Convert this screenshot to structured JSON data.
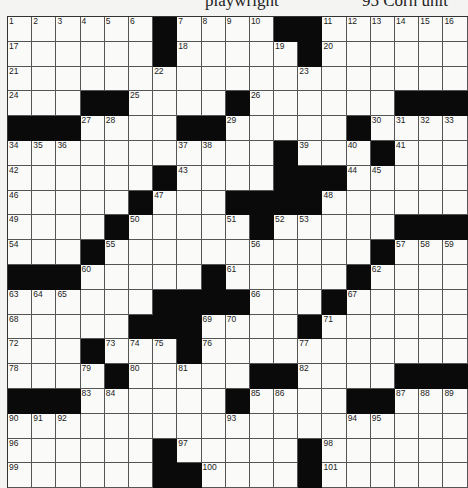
{
  "header_fragments": [
    {
      "text": "",
      "x": 30
    },
    {
      "text": "playwright",
      "x": 205
    },
    {
      "text": "95 Corn unit",
      "x": 362
    }
  ],
  "grid": {
    "cols": 19,
    "rows": 19,
    "rows_data": [
      [
        "1",
        "2",
        "3",
        "4",
        "5",
        "6",
        "#",
        "7",
        "8",
        "9",
        "10",
        "#",
        "#",
        "11",
        "12",
        "13",
        "14",
        "15",
        "16"
      ],
      [
        "17",
        "",
        "",
        "",
        "",
        "",
        "#",
        "18",
        "",
        "",
        "",
        "19",
        "#",
        "20",
        "",
        "",
        "",
        "",
        ""
      ],
      [
        "21",
        "",
        "",
        "",
        "",
        "",
        "22",
        "",
        "",
        "",
        "",
        "",
        "23",
        "",
        "",
        "",
        "",
        "",
        ""
      ],
      [
        "24",
        "",
        "",
        "#",
        "#",
        "25",
        "",
        "",
        "",
        "#",
        "26",
        "",
        "",
        "",
        "",
        "",
        "#",
        "#",
        "#"
      ],
      [
        "#",
        "#",
        "#",
        "27",
        "28",
        "",
        "",
        "#",
        "#",
        "29",
        "",
        "",
        "",
        "",
        "#",
        "30",
        "31",
        "32",
        "33"
      ],
      [
        "34",
        "35",
        "36",
        "",
        "",
        "",
        "",
        "37",
        "38",
        "",
        "",
        "#",
        "39",
        "",
        "40",
        "#",
        "41",
        "",
        ""
      ],
      [
        "42",
        "",
        "",
        "",
        "",
        "",
        "#",
        "43",
        "",
        "",
        "",
        "#",
        "#",
        "#",
        "44",
        "45",
        "",
        "",
        ""
      ],
      [
        "46",
        "",
        "",
        "",
        "",
        "#",
        "47",
        "",
        "",
        "#",
        "#",
        "#",
        "#",
        "48",
        "",
        "",
        "",
        "",
        ""
      ],
      [
        "49",
        "",
        "",
        "",
        "#",
        "50",
        "",
        "",
        "",
        "51",
        "#",
        "52",
        "53",
        "",
        "",
        "",
        "#",
        "#",
        "#"
      ],
      [
        "54",
        "",
        "",
        "#",
        "55",
        "",
        "",
        "",
        "",
        "",
        "56",
        "",
        "",
        "",
        "",
        "#",
        "57",
        "58",
        "59"
      ],
      [
        "#",
        "#",
        "#",
        "60",
        "",
        "",
        "",
        "",
        "#",
        "61",
        "",
        "",
        "",
        "",
        "#",
        "62",
        "",
        "",
        ""
      ],
      [
        "63",
        "64",
        "65",
        "",
        "",
        "",
        "#",
        "#",
        "#",
        "#",
        "66",
        "",
        "",
        "#",
        "67",
        "",
        "",
        "",
        ""
      ],
      [
        "68",
        "",
        "",
        "",
        "",
        "#",
        "#",
        "#",
        "69",
        "70",
        "",
        "",
        "#",
        "71",
        "",
        "",
        "",
        "",
        ""
      ],
      [
        "72",
        "",
        "",
        "#",
        "73",
        "74",
        "75",
        "#",
        "76",
        "",
        "",
        "",
        "77",
        "",
        "",
        "",
        "",
        "",
        ""
      ],
      [
        "78",
        "",
        "",
        "79",
        "#",
        "80",
        "",
        "81",
        "",
        "",
        "#",
        "#",
        "82",
        "",
        "",
        "",
        "#",
        "#",
        "#"
      ],
      [
        "#",
        "#",
        "#",
        "83",
        "84",
        "",
        "",
        "",
        "",
        "#",
        "85",
        "86",
        "",
        "",
        "#",
        "#",
        "87",
        "88",
        "89"
      ],
      [
        "90",
        "91",
        "92",
        "",
        "",
        "",
        "",
        "",
        "",
        "93",
        "",
        "",
        "",
        "",
        "94",
        "95",
        "",
        "",
        ""
      ],
      [
        "96",
        "",
        "",
        "",
        "",
        "",
        "#",
        "97",
        "",
        "",
        "",
        "",
        "#",
        "98",
        "",
        "",
        "",
        "",
        ""
      ],
      [
        "99",
        "",
        "",
        "",
        "",
        "",
        "#",
        "#",
        "100",
        "",
        "",
        "",
        "#",
        "101",
        "",
        "",
        "",
        "",
        ""
      ]
    ]
  }
}
